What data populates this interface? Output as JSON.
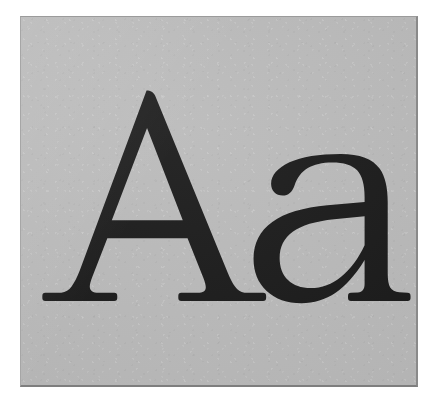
{
  "page": {
    "background_color": "#ffffff",
    "width": 440,
    "height": 409
  },
  "specimen": {
    "sample_text": "Aa",
    "glyphs": [
      {
        "character": "A",
        "case": "uppercase",
        "name": "uppercase-a-glyph"
      },
      {
        "character": "a",
        "case": "lowercase",
        "name": "lowercase-a-glyph"
      }
    ],
    "card": {
      "background_color": "#b9b9b9",
      "border_color": "#8a8a8a",
      "left": 20,
      "top": 16,
      "width": 398,
      "height": 371
    },
    "ink_color": "#171717",
    "style": "serif",
    "baseline_y": 301,
    "cap_height_top_y": 93,
    "x_height_top_y": 157
  }
}
